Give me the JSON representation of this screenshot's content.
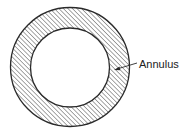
{
  "diagram": {
    "label": "Annulus",
    "colors": {
      "stroke": "#2a2a2a",
      "hatch": "#3a3a3a",
      "background": "#ffffff"
    },
    "outer_circle": {
      "cx": 70,
      "cy": 67,
      "r": 59.5
    },
    "inner_circle": {
      "cx": 70,
      "cy": 67.5,
      "r": 39.5
    }
  }
}
